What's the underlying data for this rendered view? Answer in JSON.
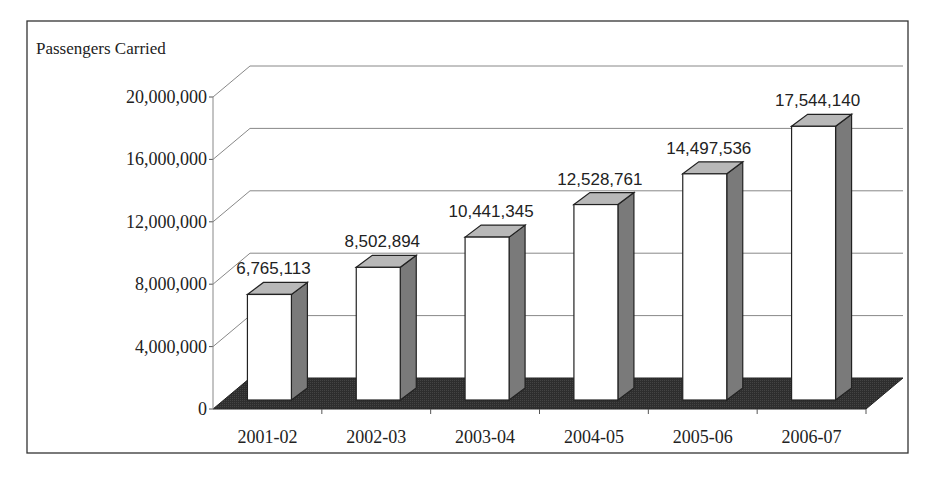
{
  "chart_data": {
    "type": "bar",
    "style": "3d-column",
    "title": "",
    "ylabel": "Passengers Carried",
    "xlabel": "",
    "categories": [
      "2001-02",
      "2002-03",
      "2003-04",
      "2004-05",
      "2005-06",
      "2006-07"
    ],
    "values": [
      6765113,
      8502894,
      10441345,
      12528761,
      14497536,
      17544140
    ],
    "data_labels": [
      "6,765,113",
      "8,502,894",
      "10,441,345",
      "12,528,761",
      "14,497,536",
      "17,544,140"
    ],
    "ylim": [
      0,
      20000000
    ],
    "yticks": [
      0,
      4000000,
      8000000,
      12000000,
      16000000,
      20000000
    ],
    "ytick_labels": [
      "0",
      "4,000,000",
      "8,000,000",
      "12,000,000",
      "16,000,000",
      "20,000,000"
    ],
    "grid": true,
    "legend": null,
    "colors": {
      "bar_face": "#ffffff",
      "bar_side": "#7a7a7a",
      "bar_top": "#b8b8b8",
      "floor": "#2e2e2e",
      "gridline": "#888888",
      "outline": "#222222"
    }
  }
}
